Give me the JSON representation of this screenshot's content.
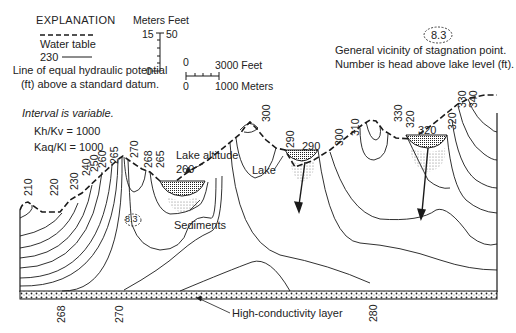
{
  "explanation": {
    "title": "EXPLANATION",
    "water_table_label": "Water table",
    "contour_sample_value": "230",
    "contour_description": "Line of equal hydraulic potential (ft) above a standard datum.",
    "interval_note": "Interval is variable.",
    "ratio_1": "Kh/Kv = 1000",
    "ratio_2": "Kaq/Kl = 1000"
  },
  "vertical_scale": {
    "header": "Meters Feet",
    "meters_top": "15",
    "meters_bottom": "0",
    "feet_top": "50"
  },
  "horizontal_scale": {
    "feet_start": "0",
    "feet_end": "3000 Feet",
    "meters_start": "0",
    "meters_end": "1000 Meters"
  },
  "stagnation_legend": {
    "symbol_value": "8.3",
    "description_line1": "General vicinity of stagnation point.",
    "description_line2": "Number is head above lake level (ft)."
  },
  "section_labels": {
    "lake_altitude": "Lake altitude",
    "lake_altitude_value": "260",
    "lake": "Lake",
    "lake2_value": "290",
    "lake3_value": "320",
    "sediments": "Sediments",
    "stagnation_value": "8.3",
    "high_conductivity_layer": "High-conductivity layer"
  },
  "contour_labels_top": [
    "210",
    "220",
    "230",
    "240",
    "250",
    "260",
    "265",
    "270",
    "268",
    "265",
    "300",
    "290",
    "300",
    "310",
    "330",
    "320",
    "320",
    "330",
    "340"
  ],
  "contour_labels_bottom": [
    "268",
    "270",
    "280"
  ],
  "colors": {
    "line": "#1a1a1a",
    "background": "#ffffff"
  }
}
